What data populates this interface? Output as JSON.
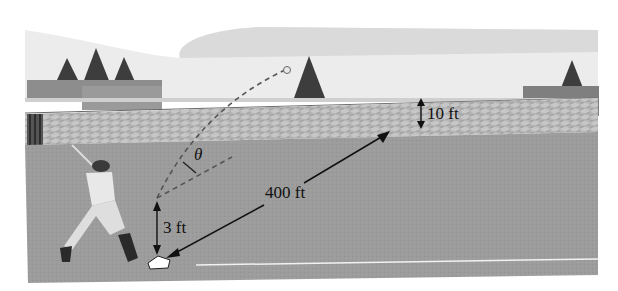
{
  "figure": {
    "labels": {
      "angle": "θ",
      "distance": "400 ft",
      "fence_height": "10 ft",
      "contact_height": "3 ft"
    },
    "colors": {
      "sky": "#ededed",
      "cloud": "#d9d9d9",
      "field": "#9a9a9a",
      "fence": "#b4b4b4",
      "trees": "#3d3d3d",
      "annotation": "#111111",
      "foul_line": "#f2f2f2"
    }
  }
}
